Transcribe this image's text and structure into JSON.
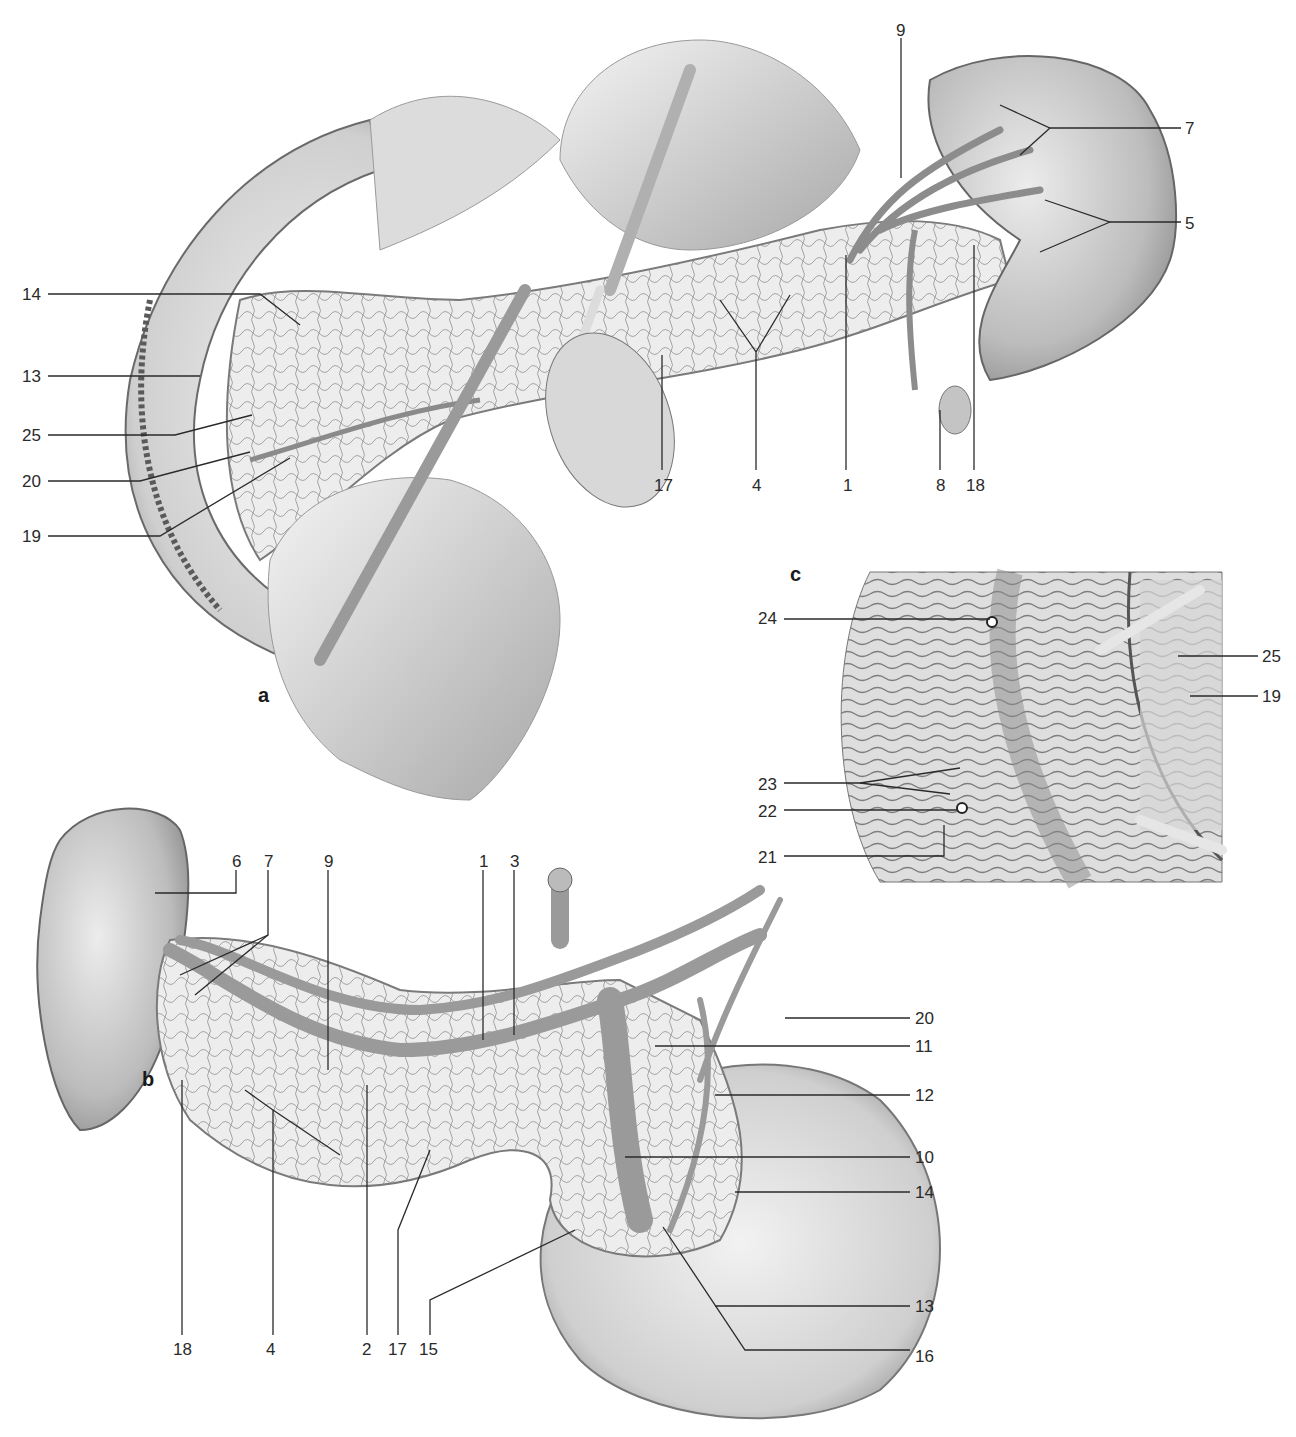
{
  "figure": {
    "panels": [
      {
        "id": "a",
        "letter": "a"
      },
      {
        "id": "b",
        "letter": "b"
      },
      {
        "id": "c",
        "letter": "c"
      }
    ],
    "panel_a": {
      "labels": [
        {
          "text": "9",
          "x": 896,
          "y": 22
        },
        {
          "text": "7",
          "x": 1185,
          "y": 120
        },
        {
          "text": "5",
          "x": 1185,
          "y": 215
        },
        {
          "text": "14",
          "x": 22,
          "y": 286
        },
        {
          "text": "13",
          "x": 22,
          "y": 368
        },
        {
          "text": "25",
          "x": 22,
          "y": 427
        },
        {
          "text": "20",
          "x": 22,
          "y": 473
        },
        {
          "text": "19",
          "x": 22,
          "y": 528
        },
        {
          "text": "17",
          "x": 654,
          "y": 477
        },
        {
          "text": "4",
          "x": 752,
          "y": 477
        },
        {
          "text": "1",
          "x": 843,
          "y": 477
        },
        {
          "text": "8",
          "x": 936,
          "y": 477
        },
        {
          "text": "18",
          "x": 966,
          "y": 477
        }
      ]
    },
    "panel_b": {
      "labels": [
        {
          "text": "6",
          "x": 232,
          "y": 853
        },
        {
          "text": "7",
          "x": 264,
          "y": 853
        },
        {
          "text": "9",
          "x": 324,
          "y": 853
        },
        {
          "text": "1",
          "x": 479,
          "y": 853
        },
        {
          "text": "3",
          "x": 510,
          "y": 853
        },
        {
          "text": "20",
          "x": 915,
          "y": 1010
        },
        {
          "text": "11",
          "x": 915,
          "y": 1038
        },
        {
          "text": "12",
          "x": 915,
          "y": 1087
        },
        {
          "text": "10",
          "x": 915,
          "y": 1149
        },
        {
          "text": "14",
          "x": 915,
          "y": 1184
        },
        {
          "text": "13",
          "x": 915,
          "y": 1298
        },
        {
          "text": "16",
          "x": 915,
          "y": 1348
        },
        {
          "text": "18",
          "x": 173,
          "y": 1341
        },
        {
          "text": "4",
          "x": 266,
          "y": 1341
        },
        {
          "text": "2",
          "x": 362,
          "y": 1341
        },
        {
          "text": "17",
          "x": 388,
          "y": 1341
        },
        {
          "text": "15",
          "x": 419,
          "y": 1341
        }
      ]
    },
    "panel_c": {
      "labels": [
        {
          "text": "24",
          "x": 758,
          "y": 610
        },
        {
          "text": "25",
          "x": 1262,
          "y": 648
        },
        {
          "text": "19",
          "x": 1262,
          "y": 688
        },
        {
          "text": "23",
          "x": 758,
          "y": 776
        },
        {
          "text": "22",
          "x": 758,
          "y": 803
        },
        {
          "text": "21",
          "x": 758,
          "y": 849
        }
      ]
    },
    "colors": {
      "tissue_light": "#e6e6e6",
      "tissue_mid": "#bdbdbd",
      "tissue_dark": "#8a8a8a",
      "vessel": "#9a9a9a",
      "line": "#2a2a2a"
    }
  }
}
